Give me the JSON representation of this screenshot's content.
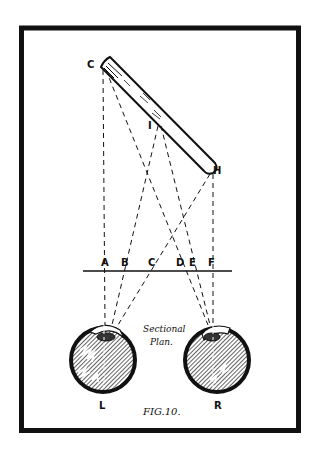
{
  "figure": {
    "caption": "FIG.10.",
    "annotation_line1": "Sectional",
    "annotation_line2": "Plan.",
    "colors": {
      "ink": "#111111",
      "paper": "#ffffff"
    }
  },
  "labels": {
    "C_top": "C",
    "I": "I",
    "H": "H",
    "A": "A",
    "B": "B",
    "C_line": "C",
    "D": "D",
    "E": "E",
    "F": "F",
    "L": "L",
    "R": "R"
  },
  "elements": {
    "rod": "slanted tube from C to H",
    "picture_plane": "horizontal line A–F",
    "left_eye": "L",
    "right_eye": "R"
  }
}
